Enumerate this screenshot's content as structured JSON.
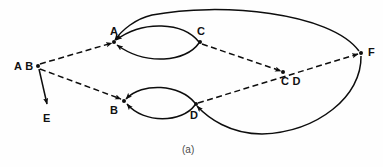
{
  "figure": {
    "caption": "(a)",
    "caption_x": 182,
    "caption_y": 145,
    "background": "#fefefe",
    "stroke_color": "#0d0d0d",
    "label_color": "#111111"
  },
  "nodes": [
    {
      "id": "AB",
      "label": "A B",
      "x": 38,
      "y": 66,
      "label_x": 14,
      "label_y": 61
    },
    {
      "id": "A",
      "label": "A",
      "x": 114,
      "y": 42,
      "label_x": 110,
      "label_y": 26
    },
    {
      "id": "C",
      "label": "C",
      "x": 200,
      "y": 42,
      "label_x": 197,
      "label_y": 26
    },
    {
      "id": "F",
      "label": "F",
      "x": 361,
      "y": 53,
      "label_x": 368,
      "label_y": 47
    },
    {
      "id": "CD",
      "label": "C D",
      "x": 283,
      "y": 72,
      "label_x": 281,
      "label_y": 76
    },
    {
      "id": "B",
      "label": "B",
      "x": 124,
      "y": 101,
      "label_x": 110,
      "label_y": 105
    },
    {
      "id": "D",
      "label": "D",
      "x": 196,
      "y": 104,
      "label_x": 190,
      "label_y": 110
    },
    {
      "id": "E",
      "label": "E",
      "x": 48,
      "y": 107,
      "label_x": 43,
      "label_y": 113
    }
  ],
  "edges": [
    {
      "id": "ab-to-a",
      "style": "dashed",
      "arrow": "end",
      "from": "AB",
      "to": "A",
      "path": "M 40 64 L 112 43"
    },
    {
      "id": "ab-to-b",
      "style": "dashed",
      "arrow": "end",
      "from": "AB",
      "to": "B",
      "path": "M 40 69 L 121 99"
    },
    {
      "id": "ab-to-e",
      "style": "solid",
      "arrow": "end",
      "from": "AB",
      "to": "E",
      "path": "M 39 69 L 47 104"
    },
    {
      "id": "c-to-a-up",
      "style": "solid",
      "arrow": "end",
      "from": "C",
      "to": "A",
      "path": "M 199 42 C 183 22 143 20 116 40"
    },
    {
      "id": "c-to-a-dn",
      "style": "solid",
      "arrow": "end",
      "from": "C",
      "to": "A",
      "path": "M 199 43 C 186 62 146 66 117 45"
    },
    {
      "id": "d-to-b-up",
      "style": "solid",
      "arrow": "end",
      "from": "D",
      "to": "B",
      "path": "M 195 103 C 180 84 142 82 126 99"
    },
    {
      "id": "d-to-b-dn",
      "style": "solid",
      "arrow": "end",
      "from": "D",
      "to": "B",
      "path": "M 195 105 C 182 123 144 124 127 104"
    },
    {
      "id": "c-to-cd",
      "style": "dashed",
      "arrow": "end",
      "from": "C",
      "to": "CD",
      "path": "M 202 44 L 281 71"
    },
    {
      "id": "d-to-f",
      "style": "dashed",
      "arrow": "end",
      "from": "D",
      "to": "F",
      "path": "M 198 103 L 358 54"
    },
    {
      "id": "f-to-a",
      "style": "solid",
      "arrow": "end",
      "from": "F",
      "to": "A",
      "path": "M 359 51 C 330 12 220 2 152 15 C 135 19 122 30 115 40"
    },
    {
      "id": "f-to-d",
      "style": "solid",
      "arrow": "end",
      "from": "F",
      "to": "D",
      "path": "M 361 56 C 362 96 318 132 262 134 C 230 134 208 118 197 106"
    }
  ]
}
